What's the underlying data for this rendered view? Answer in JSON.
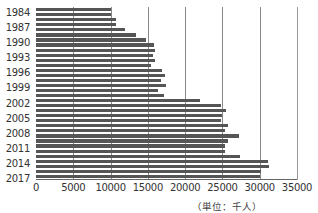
{
  "chart_data": {
    "type": "bar",
    "orientation": "horizontal",
    "title": "",
    "xlabel": "",
    "ylabel": "",
    "unit_note": "（単位：千人）",
    "xlim": [
      0,
      35000
    ],
    "x_ticks": [
      "0",
      "5000",
      "10000",
      "15000",
      "20000",
      "25000",
      "30000",
      "35000"
    ],
    "y_tick_labels": [
      "1984",
      "1987",
      "1990",
      "1993",
      "1996",
      "1999",
      "2002",
      "2005",
      "2008",
      "2011",
      "2014",
      "2017"
    ],
    "grid": "vertical",
    "legend": null,
    "bar_color": "#555555",
    "categories": [
      "1984",
      "1985",
      "1986",
      "1987",
      "1988",
      "1989",
      "1990",
      "1991",
      "1992",
      "1993",
      "1994",
      "1995",
      "1996",
      "1997",
      "1998",
      "1999",
      "2000",
      "2001",
      "2002",
      "2003",
      "2004",
      "2005",
      "2006",
      "2007",
      "2008",
      "2009",
      "2010",
      "2011",
      "2012",
      "2013",
      "2014",
      "2015",
      "2016",
      "2017"
    ],
    "values": [
      10000,
      10000,
      10700,
      10700,
      12000,
      13400,
      14700,
      15800,
      16000,
      15700,
      16000,
      15400,
      16900,
      17300,
      16700,
      17400,
      16400,
      17200,
      22000,
      24800,
      25500,
      25000,
      24800,
      25700,
      25400,
      27200,
      25700,
      25300,
      25300,
      27400,
      31100,
      31300,
      30200,
      30000
    ]
  }
}
